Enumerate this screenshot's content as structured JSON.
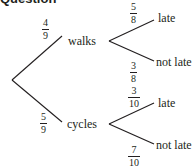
{
  "heading": {
    "text": "Question"
  },
  "tree": {
    "level1": [
      {
        "outcome": "walks",
        "probability": {
          "numerator": "4",
          "denominator": "9"
        }
      },
      {
        "outcome": "cycles",
        "probability": {
          "numerator": "5",
          "denominator": "9"
        }
      }
    ],
    "walks_branches": [
      {
        "outcome": "late",
        "probability": {
          "numerator": "5",
          "denominator": "8"
        }
      },
      {
        "outcome": "not late",
        "probability": {
          "numerator": "3",
          "denominator": "8"
        }
      }
    ],
    "cycles_branches": [
      {
        "outcome": "late",
        "probability": {
          "numerator": "3",
          "denominator": "10"
        }
      },
      {
        "outcome": "not late",
        "probability": {
          "numerator": "7",
          "denominator": "10"
        }
      }
    ]
  },
  "colors": {
    "line": "#231f20",
    "text": "#231f20",
    "background": "#ffffff"
  }
}
